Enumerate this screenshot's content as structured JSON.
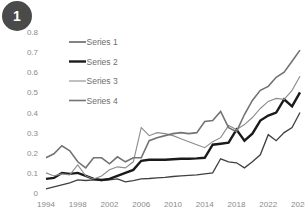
{
  "badge": {
    "label": "1",
    "color": "#4a4a4a",
    "text_color": "#ffffff"
  },
  "legend": {
    "position": "inside-top-left",
    "entries": [
      {
        "label": "Series 1",
        "color": "#404040",
        "width": 1.3
      },
      {
        "label": "Series 2",
        "color": "#1a1a1a",
        "width": 2.4
      },
      {
        "label": "Series 3",
        "color": "#8c8c8c",
        "width": 1.1
      },
      {
        "label": "Series 4",
        "color": "#737373",
        "width": 1.6
      }
    ]
  },
  "chart_data": {
    "type": "line",
    "title": "",
    "subtitle": "",
    "xlabel": "",
    "ylabel": "",
    "xlim": [
      1994,
      2026
    ],
    "ylim": [
      0,
      0.8
    ],
    "grid": false,
    "legend_position": "inside-top-left",
    "y_ticks": [
      "0",
      "0.1",
      "0.2",
      "0.3",
      "0.4",
      "0.5",
      "0.6",
      "0.7",
      "0.8"
    ],
    "y_tick_values": [
      0,
      0.1,
      0.2,
      0.3,
      0.4,
      0.5,
      0.6,
      0.7,
      0.8
    ],
    "x_ticks": [
      "1994",
      "1998",
      "2002",
      "2006",
      "2010",
      "2014",
      "2018",
      "2022",
      "2026"
    ],
    "x_tick_values": [
      1994,
      1998,
      2002,
      2006,
      2010,
      2014,
      2018,
      2022,
      2026
    ],
    "x": [
      1994,
      1995,
      1996,
      1997,
      1998,
      1999,
      2000,
      2001,
      2002,
      2003,
      2004,
      2005,
      2006,
      2007,
      2008,
      2009,
      2010,
      2011,
      2012,
      2013,
      2014,
      2015,
      2016,
      2017,
      2018,
      2019,
      2020,
      2021,
      2022,
      2023,
      2024,
      2025,
      2026
    ],
    "series": [
      {
        "name": "Series 1",
        "color": "#404040",
        "width": 1.3,
        "values": [
          0.02,
          0.03,
          0.04,
          0.05,
          0.065,
          0.062,
          0.065,
          0.062,
          0.065,
          0.07,
          0.055,
          0.062,
          0.07,
          0.072,
          0.075,
          0.078,
          0.082,
          0.085,
          0.088,
          0.09,
          0.095,
          0.1,
          0.17,
          0.155,
          0.15,
          0.125,
          0.155,
          0.19,
          0.29,
          0.26,
          0.3,
          0.325,
          0.4
        ]
      },
      {
        "name": "Series 2",
        "color": "#1a1a1a",
        "width": 2.4,
        "values": [
          0.07,
          0.075,
          0.1,
          0.095,
          0.1,
          0.085,
          0.07,
          0.065,
          0.07,
          0.085,
          0.1,
          0.115,
          0.16,
          0.165,
          0.165,
          0.165,
          0.168,
          0.17,
          0.17,
          0.172,
          0.175,
          0.24,
          0.245,
          0.25,
          0.315,
          0.26,
          0.295,
          0.36,
          0.385,
          0.4,
          0.465,
          0.43,
          0.5
        ]
      },
      {
        "name": "Series 3",
        "color": "#8c8c8c",
        "width": 1.1,
        "values": [
          0.1,
          0.085,
          0.095,
          0.09,
          0.14,
          0.085,
          0.07,
          0.085,
          0.115,
          0.13,
          0.125,
          0.155,
          0.325,
          0.285,
          0.3,
          0.295,
          0.285,
          0.27,
          0.255,
          0.24,
          0.225,
          0.255,
          0.275,
          0.335,
          0.315,
          0.34,
          0.375,
          0.42,
          0.455,
          0.47,
          0.465,
          0.51,
          0.58
        ]
      },
      {
        "name": "Series 4",
        "color": "#737373",
        "width": 1.6,
        "values": [
          0.175,
          0.195,
          0.235,
          0.21,
          0.155,
          0.125,
          0.175,
          0.175,
          0.145,
          0.18,
          0.155,
          0.175,
          0.175,
          0.26,
          0.275,
          0.285,
          0.295,
          0.3,
          0.295,
          0.3,
          0.355,
          0.36,
          0.405,
          0.325,
          0.305,
          0.39,
          0.46,
          0.51,
          0.53,
          0.575,
          0.6,
          0.655,
          0.71
        ]
      }
    ]
  }
}
